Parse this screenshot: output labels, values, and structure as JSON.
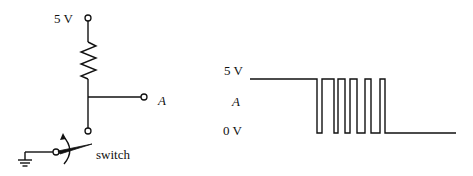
{
  "circuit": {
    "supply_label": "5 V",
    "output_label": "A",
    "switch_label": "switch",
    "components": [
      "5 V terminal",
      "resistor",
      "output node A",
      "switch",
      "ground"
    ]
  },
  "waveform": {
    "high_label": "5 V",
    "signal_label": "A",
    "low_label": "0 V",
    "description": "Signal A starts high at 5 V, bounces between 0 V and 5 V several times while the switch closes, then settles at 0 V",
    "levels": {
      "high": "5 V",
      "low": "0 V"
    },
    "pulses_during_bounce": 5
  }
}
